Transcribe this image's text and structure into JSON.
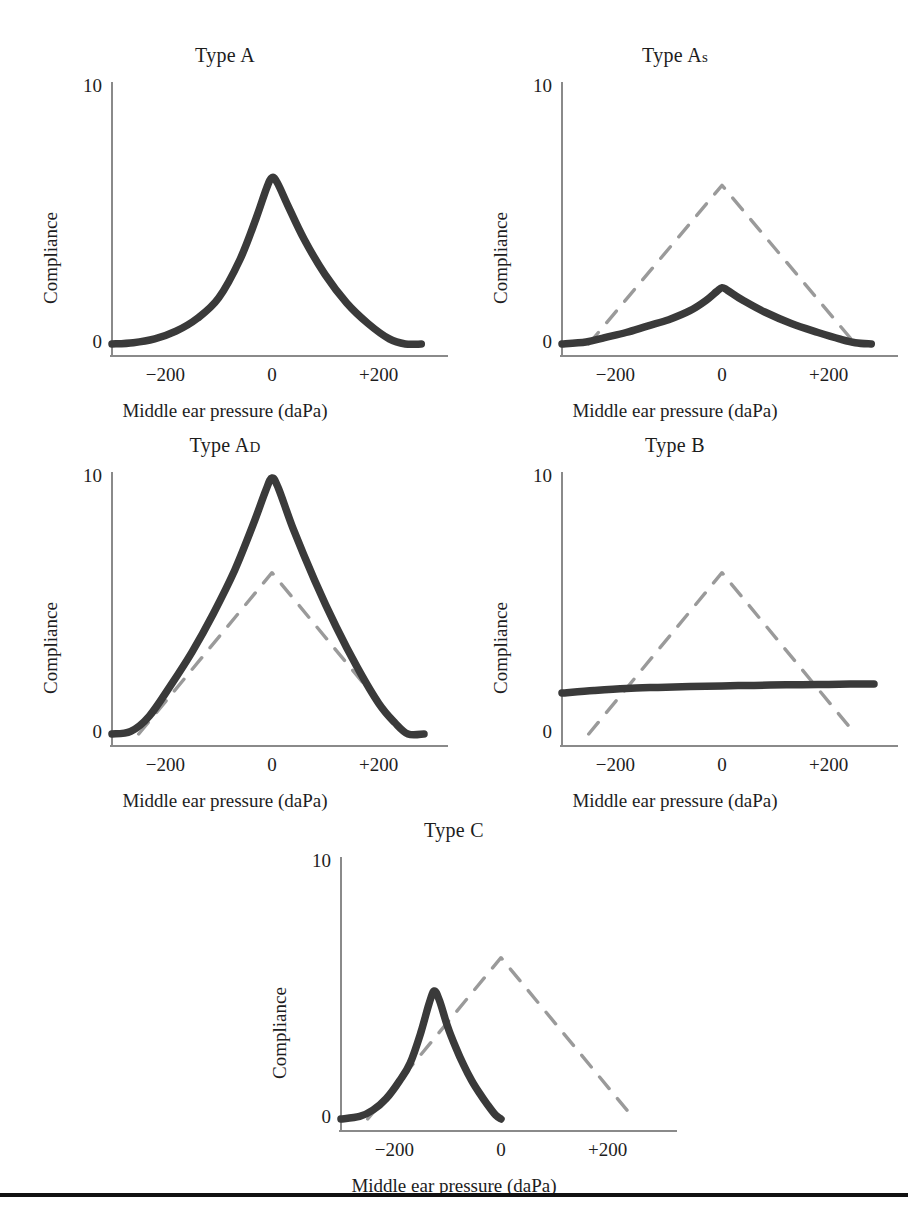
{
  "figure": {
    "background": "#ffffff",
    "ink": "#3a3a3a",
    "dash_ink": "#9a9a9a",
    "axis_ink": "#8a8a8a",
    "rule_color": "#111111"
  },
  "axes": {
    "xlabel": "Middle ear pressure (daPa)",
    "ylabel": "Compliance",
    "xticks": [
      "−200",
      "0",
      "+200"
    ],
    "xtick_values": [
      -200,
      0,
      200
    ],
    "yticks": [
      "10",
      "0"
    ],
    "ytick_values": [
      10,
      0
    ],
    "xlim": [
      -300,
      300
    ],
    "ylim": [
      -0.6,
      10.6
    ],
    "grid": "off"
  },
  "panels": [
    {
      "id": "type-a",
      "title": "Type A",
      "title_main": "Type A",
      "title_sub": "",
      "x": 0,
      "y": 40
    },
    {
      "id": "type-as",
      "title": "Type As",
      "title_main": "Type A",
      "title_sub": "s",
      "x": 450,
      "y": 40
    },
    {
      "id": "type-ad",
      "title": "Type AD",
      "title_main": "Type A",
      "title_sub": "D",
      "x": 0,
      "y": 430
    },
    {
      "id": "type-b",
      "title": "Type B",
      "title_main": "Type B",
      "title_sub": "",
      "x": 450,
      "y": 430
    },
    {
      "id": "type-c",
      "title": "Type C",
      "title_main": "Type C",
      "title_sub": "",
      "x": 229,
      "y": 815
    }
  ],
  "chart_data": {
    "type": "line",
    "xlabel": "Middle ear pressure (daPa)",
    "ylabel": "Compliance",
    "xlim": [
      -300,
      300
    ],
    "ylim": [
      -0.6,
      10.6
    ],
    "xticks": [
      -200,
      0,
      200
    ],
    "yticks": [
      0,
      10
    ],
    "grid": "off",
    "legend": "none",
    "charts": [
      {
        "panel": "Type A",
        "series": [
          {
            "name": "Type A tympanogram",
            "style": "solid",
            "peak_pressure": 0,
            "peak_compliance": 6.5,
            "x": [
              -300,
              -260,
              -220,
              -180,
              -140,
              -100,
              -60,
              -30,
              -10,
              0,
              10,
              30,
              60,
              100,
              140,
              180,
              220,
              250,
              280
            ],
            "y": [
              0.0,
              0.05,
              0.2,
              0.5,
              1.0,
              1.8,
              3.3,
              4.9,
              6.1,
              6.5,
              6.3,
              5.4,
              4.1,
              2.7,
              1.6,
              0.8,
              0.2,
              0.0,
              0.0
            ]
          }
        ]
      },
      {
        "panel": "Type As",
        "series": [
          {
            "name": "Type As tympanogram",
            "style": "solid",
            "peak_pressure": 0,
            "peak_compliance": 2.2,
            "x": [
              -300,
              -255,
              -220,
              -180,
              -140,
              -100,
              -60,
              -30,
              -10,
              0,
              10,
              40,
              80,
              130,
              180,
              220,
              250,
              280
            ],
            "y": [
              0.0,
              0.08,
              0.25,
              0.45,
              0.7,
              0.95,
              1.3,
              1.7,
              2.05,
              2.2,
              2.1,
              1.7,
              1.25,
              0.8,
              0.45,
              0.2,
              0.05,
              0.0
            ]
          },
          {
            "name": "Type A reference",
            "style": "dashed",
            "peak_pressure": 0,
            "peak_compliance": 6.2,
            "x": [
              -250,
              0,
              250
            ],
            "y": [
              0.0,
              6.2,
              0.0
            ]
          }
        ]
      },
      {
        "panel": "Type AD",
        "series": [
          {
            "name": "Type AD tympanogram",
            "style": "solid",
            "peak_pressure": 0,
            "peak_compliance": 10.0,
            "x": [
              -300,
              -265,
              -230,
              -190,
              -150,
              -110,
              -70,
              -35,
              -12,
              0,
              12,
              40,
              80,
              120,
              160,
              200,
              230,
              255,
              285
            ],
            "y": [
              0.0,
              0.1,
              0.7,
              1.9,
              3.2,
              4.7,
              6.4,
              8.2,
              9.5,
              10.0,
              9.6,
              8.0,
              6.0,
              4.2,
              2.6,
              1.2,
              0.45,
              0.0,
              0.0
            ]
          },
          {
            "name": "Type A reference",
            "style": "dashed",
            "peak_pressure": 0,
            "peak_compliance": 6.3,
            "x": [
              -250,
              0,
              250
            ],
            "y": [
              0.0,
              6.3,
              0.0
            ]
          }
        ]
      },
      {
        "panel": "Type B",
        "series": [
          {
            "name": "Type B tympanogram",
            "style": "solid",
            "peak_pressure": null,
            "peak_compliance": 1.8,
            "flat": true,
            "x": [
              -300,
              -240,
              -180,
              -120,
              -60,
              0,
              60,
              120,
              180,
              240,
              285
            ],
            "y": [
              1.6,
              1.7,
              1.78,
              1.82,
              1.85,
              1.88,
              1.9,
              1.92,
              1.93,
              1.95,
              1.95
            ]
          },
          {
            "name": "Type A reference",
            "style": "dashed",
            "peak_pressure": 0,
            "peak_compliance": 6.3,
            "x": [
              -250,
              0,
              250
            ],
            "y": [
              0.0,
              6.3,
              0.0
            ]
          }
        ]
      },
      {
        "panel": "Type C",
        "series": [
          {
            "name": "Type C tympanogram",
            "style": "solid",
            "peak_pressure": -125,
            "peak_compliance": 5.0,
            "x": [
              -300,
              -265,
              -240,
              -215,
              -190,
              -170,
              -150,
              -135,
              -125,
              -115,
              -100,
              -85,
              -70,
              -55,
              -40,
              -25,
              -10,
              0
            ],
            "y": [
              0.0,
              0.1,
              0.35,
              0.8,
              1.5,
              2.2,
              3.4,
              4.5,
              5.0,
              4.6,
              3.6,
              2.8,
              2.1,
              1.5,
              1.0,
              0.55,
              0.15,
              0.0
            ]
          },
          {
            "name": "Type A reference",
            "style": "dashed",
            "peak_pressure": 0,
            "peak_compliance": 6.3,
            "x": [
              -250,
              0,
              250
            ],
            "y": [
              0.0,
              6.3,
              0.0
            ]
          }
        ]
      }
    ]
  }
}
